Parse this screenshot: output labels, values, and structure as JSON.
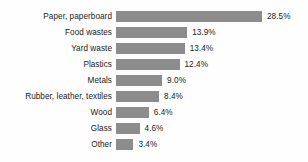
{
  "chart_data": {
    "type": "bar",
    "orientation": "horizontal",
    "title": "",
    "subtitle": "",
    "xlabel": "",
    "ylabel": "",
    "grid": false,
    "legend": "none",
    "axis_visible": false,
    "xlim": [
      0,
      28.5
    ],
    "value_suffix": "%",
    "categories": [
      "Paper, paperboard",
      "Food wastes",
      "Yard waste",
      "Plastics",
      "Metals",
      "Rubber, leather, textiles",
      "Wood",
      "Glass",
      "Other"
    ],
    "values": [
      28.5,
      13.9,
      13.4,
      12.4,
      9.0,
      8.4,
      6.4,
      4.6,
      3.4
    ],
    "value_labels": [
      "28.5%",
      "13.9%",
      "13.4%",
      "12.4%",
      "9.0%",
      "8.4%",
      "6.4%",
      "4.6%",
      "3.4%"
    ],
    "colors": {
      "bar": "#8c8c8c",
      "text": "#1a1a1a",
      "background": "#fefefe"
    }
  }
}
